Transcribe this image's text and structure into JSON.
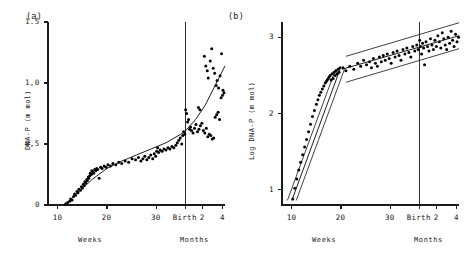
{
  "figure": {
    "panels": [
      {
        "label": "(a)",
        "ylabel": "DNA-P (m mol)",
        "yticks": [
          "1.5",
          "1,0",
          "0,5",
          "0"
        ],
        "ytick_values": [
          1.5,
          1.0,
          0.5,
          0
        ],
        "xticks": [
          "10",
          "20",
          "30",
          "Birth",
          "2",
          "4"
        ],
        "xaxis_left_name": "Weeks",
        "xaxis_right_name": "Months"
      },
      {
        "label": "(b)",
        "ylabel": "Log DNA-P (m mol)",
        "yticks": [
          "3",
          "2",
          "1"
        ],
        "ytick_values": [
          3,
          2,
          1
        ],
        "xticks": [
          "10",
          "20",
          "30",
          "Birth",
          "2",
          "4"
        ],
        "xaxis_left_name": "Weeks",
        "xaxis_right_name": "Months"
      }
    ]
  },
  "chart_data": [
    {
      "type": "scatter",
      "panel": "(a)",
      "title": "",
      "xlabel": "Weeks / Months",
      "ylabel": "DNA-P (m mol)",
      "ylim": [
        0,
        1.5
      ],
      "xlim": [
        8,
        44
      ],
      "grid": false,
      "legend": null,
      "annotations": [
        "Birth"
      ],
      "xtick_positions": [
        10,
        20,
        30,
        36,
        39.4,
        43.5
      ],
      "xtick_labels": [
        "10",
        "20",
        "30",
        "Birth",
        "2",
        "4"
      ],
      "ytick_positions": [
        0,
        0.5,
        1.0,
        1.5
      ],
      "ytick_labels": [
        "0",
        "0,5",
        "1,0",
        "1.5"
      ],
      "series": [
        {
          "name": "DNA-P observations",
          "x": [
            11.6,
            12.0,
            12.4,
            12.6,
            12.9,
            13.2,
            13.4,
            13.6,
            13.9,
            14.1,
            14.3,
            14.6,
            14.8,
            15.0,
            15.2,
            15.4,
            15.5,
            15.7,
            15.9,
            16.0,
            16.2,
            16.3,
            16.5,
            16.6,
            16.8,
            16.9,
            17.1,
            17.3,
            17.5,
            17.7,
            17.9,
            18.1,
            18.4,
            18.7,
            19.0,
            19.4,
            19.8,
            20.2,
            20.7,
            21.2,
            21.8,
            22.4,
            23.0,
            23.7,
            24.4,
            25.1,
            25.8,
            26.4,
            26.9,
            27.3,
            27.7,
            28.1,
            28.5,
            28.9,
            29.3,
            29.6,
            29.9,
            30.1,
            30.3,
            30.5,
            30.8,
            31.2,
            31.6,
            32.0,
            32.4,
            32.8,
            33.2,
            33.6,
            34.0,
            34.3,
            34.6,
            34.9,
            35.2,
            35.4,
            35.6,
            35.8,
            36.0,
            36.2,
            36.4,
            36.6,
            36.8,
            37.0,
            37.2,
            37.5,
            37.8,
            38.1,
            38.4,
            38.7,
            39.0,
            39.3,
            39.6,
            39.9,
            40.2,
            40.5,
            40.8,
            41.1,
            41.4,
            41.7,
            42.0,
            42.3,
            42.6,
            42.9,
            43.2,
            43.5,
            43.8
          ],
          "y": [
            0.01,
            0.02,
            0.03,
            0.05,
            0.04,
            0.07,
            0.09,
            0.08,
            0.11,
            0.1,
            0.13,
            0.12,
            0.15,
            0.14,
            0.17,
            0.16,
            0.19,
            0.18,
            0.21,
            0.2,
            0.23,
            0.22,
            0.24,
            0.26,
            0.25,
            0.28,
            0.27,
            0.26,
            0.29,
            0.28,
            0.3,
            0.29,
            0.22,
            0.31,
            0.3,
            0.32,
            0.31,
            0.33,
            0.32,
            0.34,
            0.33,
            0.35,
            0.34,
            0.36,
            0.35,
            0.38,
            0.37,
            0.39,
            0.36,
            0.38,
            0.4,
            0.37,
            0.39,
            0.41,
            0.38,
            0.42,
            0.4,
            0.44,
            0.47,
            0.43,
            0.45,
            0.44,
            0.46,
            0.45,
            0.47,
            0.46,
            0.48,
            0.47,
            0.49,
            0.51,
            0.53,
            0.55,
            0.5,
            0.57,
            0.6,
            0.58,
            0.78,
            0.75,
            0.68,
            0.7,
            0.62,
            0.64,
            0.61,
            0.59,
            0.63,
            0.66,
            0.6,
            0.62,
            0.65,
            0.67,
            0.61,
            0.59,
            0.63,
            0.56,
            0.58,
            0.57,
            0.54,
            0.55,
            0.72,
            0.74,
            0.76,
            0.7,
            0.88,
            0.9,
            0.92
          ]
        },
        {
          "name": "post-birth high scatter",
          "x": [
            39.8,
            40.1,
            40.4,
            40.6,
            41.0,
            41.3,
            41.6,
            41.9,
            42.2,
            42.4,
            42.7,
            43.0,
            43.3,
            43.6,
            38.6,
            38.9
          ],
          "y": [
            1.22,
            1.14,
            1.1,
            1.04,
            1.18,
            1.28,
            1.12,
            1.08,
            0.98,
            1.02,
            0.96,
            1.06,
            1.24,
            0.94,
            0.8,
            0.78
          ]
        }
      ],
      "fit": {
        "name": "smoothed growth curve",
        "x": [
          11.5,
          14,
          17,
          20,
          23,
          26,
          29,
          32,
          35,
          36,
          38,
          40,
          42,
          44
        ],
        "y": [
          0.0,
          0.1,
          0.21,
          0.3,
          0.36,
          0.41,
          0.46,
          0.51,
          0.58,
          0.61,
          0.7,
          0.82,
          0.98,
          1.14
        ]
      }
    },
    {
      "type": "scatter",
      "panel": "(b)",
      "title": "",
      "xlabel": "Weeks / Months",
      "ylabel": "Log DNA-P (m mol)",
      "ylim": [
        0.8,
        3.2
      ],
      "xlim": [
        8,
        44
      ],
      "grid": false,
      "legend": null,
      "annotations": [
        "Birth"
      ],
      "xtick_positions": [
        10,
        20,
        30,
        36,
        39.4,
        43.5
      ],
      "xtick_labels": [
        "10",
        "20",
        "30",
        "Birth",
        "2",
        "4"
      ],
      "ytick_positions": [
        1,
        2,
        3
      ],
      "ytick_labels": [
        "1",
        "2",
        "3"
      ],
      "series": [
        {
          "name": "Log DNA-P observations (steep phase)",
          "x": [
            10.2,
            10.6,
            11.0,
            11.4,
            11.8,
            12.2,
            12.6,
            13.0,
            13.4,
            13.8,
            14.2,
            14.6,
            15.0,
            15.3,
            15.6,
            15.9,
            16.2,
            16.5,
            16.8,
            17.0,
            17.2,
            17.4,
            17.6,
            17.8,
            18.0,
            18.2,
            18.4,
            18.6,
            18.8,
            19.0,
            19.2,
            19.4,
            19.6,
            19.8
          ],
          "y": [
            0.88,
            1.02,
            1.14,
            1.26,
            1.36,
            1.46,
            1.56,
            1.66,
            1.76,
            1.86,
            1.96,
            2.04,
            2.12,
            2.18,
            2.24,
            2.28,
            2.32,
            2.36,
            2.4,
            2.42,
            2.44,
            2.46,
            2.48,
            2.5,
            2.44,
            2.52,
            2.46,
            2.54,
            2.5,
            2.56,
            2.52,
            2.58,
            2.54,
            2.6
          ]
        },
        {
          "name": "Log DNA-P observations (shallow phase)",
          "x": [
            20.4,
            21.0,
            21.8,
            22.6,
            23.4,
            24.0,
            24.6,
            25.2,
            25.8,
            26.2,
            26.6,
            27.0,
            27.4,
            27.8,
            28.2,
            28.6,
            29.0,
            29.4,
            29.8,
            30.2,
            30.6,
            31.0,
            31.4,
            31.8,
            32.2,
            32.6,
            33.0,
            33.4,
            33.8,
            34.2,
            34.6,
            35.0,
            35.4,
            35.7,
            36.0,
            36.2,
            36.4,
            36.6,
            36.8,
            37.0,
            37.3,
            37.6,
            37.9,
            38.2,
            38.5,
            38.8,
            39.1,
            39.4,
            39.7,
            40.0,
            40.3,
            40.6,
            40.9,
            41.2,
            41.5,
            41.8,
            42.1,
            42.4,
            42.7,
            43.0,
            43.3,
            43.6,
            43.9
          ],
          "y": [
            2.6,
            2.56,
            2.62,
            2.58,
            2.66,
            2.62,
            2.7,
            2.64,
            2.68,
            2.6,
            2.72,
            2.66,
            2.62,
            2.74,
            2.68,
            2.76,
            2.7,
            2.78,
            2.72,
            2.66,
            2.8,
            2.74,
            2.82,
            2.76,
            2.7,
            2.84,
            2.78,
            2.86,
            2.8,
            2.74,
            2.88,
            2.82,
            2.9,
            2.84,
            2.96,
            2.88,
            2.78,
            2.92,
            2.86,
            2.64,
            2.94,
            2.88,
            2.82,
            2.98,
            2.9,
            2.84,
            2.96,
            2.88,
            3.02,
            2.94,
            2.86,
            3.06,
            2.98,
            2.9,
            2.84,
            3.0,
            2.92,
            3.08,
            2.96,
            2.88,
            3.04,
            2.94,
            3.0
          ]
        }
      ],
      "fit_segments": [
        {
          "name": "steep regression (10-20 weeks)",
          "x": [
            10.0,
            19.8
          ],
          "y": [
            0.86,
            2.58
          ],
          "band_offset_x": 0.9
        },
        {
          "name": "shallow regression (20 weeks - 4 months)",
          "x": [
            20.2,
            44.0
          ],
          "y": [
            2.58,
            3.02
          ],
          "band_offset_y": 0.17
        }
      ]
    }
  ]
}
